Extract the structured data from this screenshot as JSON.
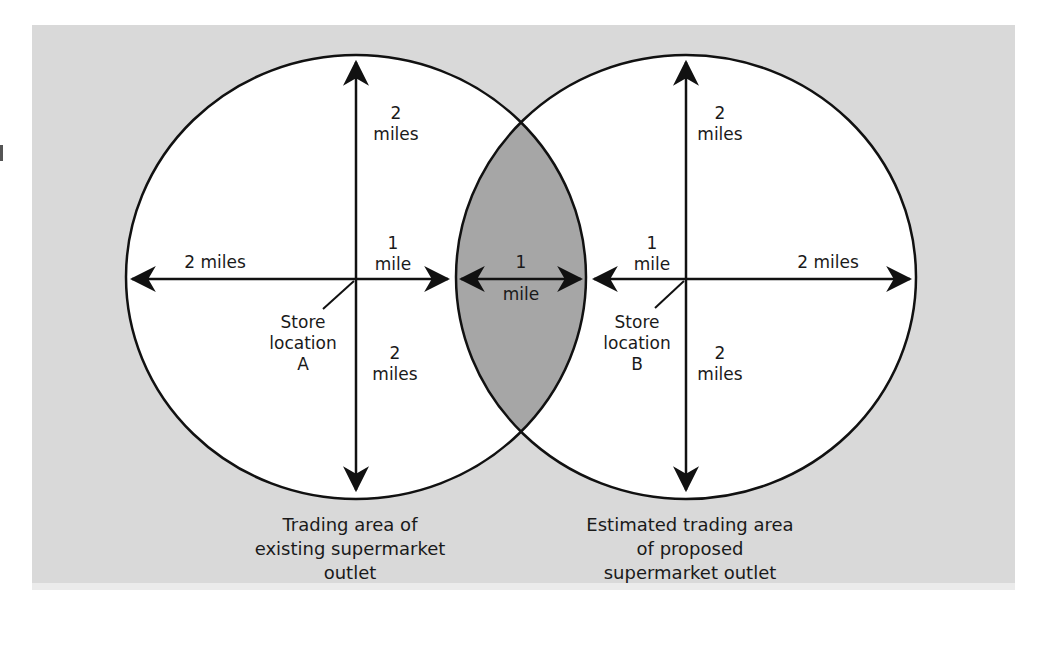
{
  "diagram": {
    "colors": {
      "panel_background": "#d9d9d9",
      "circle_fill": "#ffffff",
      "overlap_fill": "#a6a6a6",
      "stroke": "#111111"
    },
    "store_a": {
      "label": "Store\nlocation\nA",
      "up_distance": "2\nmiles",
      "down_distance": "2\nmiles",
      "left_distance": "2 miles",
      "right_distance": "1\nmile",
      "caption": "Trading area of\nexisting supermarket\noutlet"
    },
    "store_b": {
      "label": "Store\nlocation\nB",
      "up_distance": "2\nmiles",
      "down_distance": "2\nmiles",
      "left_distance": "1\nmile",
      "right_distance": "2 miles",
      "caption": "Estimated trading area\nof proposed\nsupermarket outlet"
    },
    "overlap": {
      "distance": "1",
      "distance_unit": "mile"
    }
  }
}
